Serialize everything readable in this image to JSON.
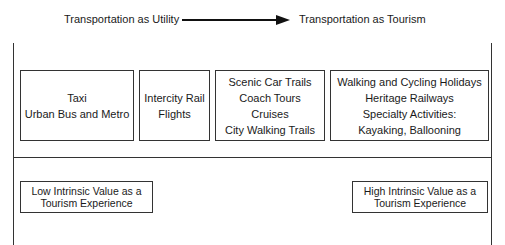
{
  "header": {
    "left_label": "Transportation as Utility",
    "right_label": "Transportation as Tourism",
    "arrow": "right-arrow"
  },
  "categories": [
    {
      "lines": [
        "Taxi",
        "Urban Bus and Metro"
      ]
    },
    {
      "lines": [
        "Intercity Rail",
        "Flights"
      ]
    },
    {
      "lines": [
        "Scenic Car Trails",
        "Coach Tours",
        "Cruises",
        "City Walking Trails"
      ]
    },
    {
      "lines": [
        "Walking and Cycling Holidays",
        "Heritage Railways",
        "Specialty Activities:",
        "Kayaking, Ballooning"
      ]
    }
  ],
  "scale": {
    "low": {
      "lines": [
        "Low Intrinsic Value as a",
        "Tourism Experience"
      ]
    },
    "high": {
      "lines": [
        "High Intrinsic Value as a",
        "Tourism Experience"
      ]
    }
  }
}
